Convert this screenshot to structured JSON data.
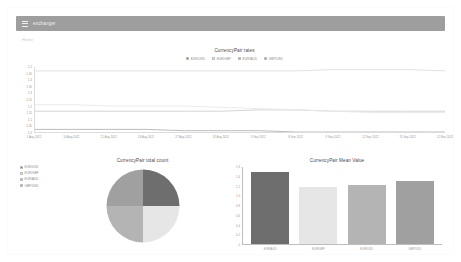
{
  "header": {
    "menu_icon": "hamburger-menu-icon",
    "title": "exchanger"
  },
  "breadcrumb": "Home",
  "colors": {
    "appbar": "#9e9e9e",
    "series1": "#6e6e6e",
    "series2": "#e6e6e6",
    "series3": "#b4b4b4",
    "series4": "#a0a0a0"
  },
  "line_chart": {
    "title": "CurrencyPair rates",
    "legend": [
      {
        "label": "EUR/USD",
        "color": "#6e6e6e"
      },
      {
        "label": "EUR/GBP",
        "color": "#e6e6e6"
      },
      {
        "label": "EUR/AUD",
        "color": "#b4b4b4"
      },
      {
        "label": "GBP/USD",
        "color": "#a0a0a0"
      }
    ]
  },
  "side_legend": [
    {
      "label": "EUR/USD",
      "color": "#6e6e6e"
    },
    {
      "label": "EUR/GBP",
      "color": "#e6e6e6"
    },
    {
      "label": "EUR/AUD",
      "color": "#b4b4b4"
    },
    {
      "label": "GBP/USD",
      "color": "#a0a0a0"
    }
  ],
  "pie_chart": {
    "title": "CurrencyPair total count"
  },
  "bar_chart": {
    "title": "CurrencyPair Mean Value"
  },
  "chart_data": [
    {
      "type": "line",
      "title": "CurrencyPair rates",
      "xlabel": "",
      "ylabel": "",
      "ylim": [
        1.0,
        1.5
      ],
      "yticks": [
        1.5,
        1.45,
        1.4,
        1.35,
        1.3,
        1.25,
        1.2,
        1.15,
        1.1,
        1.05,
        1.0
      ],
      "grid": false,
      "legend_position": "top",
      "x": [
        "1 Aug 2022",
        "14 Aug 2022",
        "21 Aug 2022",
        "24 Aug 2022",
        "27 Aug 2022",
        "31 Aug 2022",
        "3 Sep 2022",
        "6 Sep 2022",
        "9 Sep 2022",
        "12 Sep 2022",
        "15 Sep 2022",
        "12 Nov 2022"
      ],
      "series": [
        {
          "name": "EUR/USD",
          "color": "#b4b4b4",
          "values": [
            1.02,
            1.02,
            1.02,
            1.02,
            1.01,
            1.01,
            1.01,
            1.0,
            1.0,
            1.0,
            1.0,
            1.0
          ]
        },
        {
          "name": "EUR/GBP",
          "color": "#cfcfcf",
          "values": [
            1.16,
            1.16,
            1.16,
            1.16,
            1.16,
            1.16,
            1.17,
            1.17,
            1.16,
            1.16,
            1.16,
            1.16
          ]
        },
        {
          "name": "EUR/AUD",
          "color": "#dedede",
          "values": [
            1.47,
            1.47,
            1.47,
            1.47,
            1.47,
            1.47,
            1.47,
            1.47,
            1.48,
            1.48,
            1.48,
            1.47
          ]
        },
        {
          "name": "GBP/USD",
          "color": "#e8e8e8",
          "values": [
            1.21,
            1.21,
            1.2,
            1.2,
            1.2,
            1.19,
            1.18,
            1.17,
            1.16,
            1.15,
            1.15,
            1.15
          ]
        }
      ]
    },
    {
      "type": "pie",
      "title": "CurrencyPair total count",
      "labels": [
        "EUR/USD",
        "EUR/GBP",
        "EUR/AUD",
        "GBP/USD"
      ],
      "values": [
        25,
        25,
        25,
        25
      ],
      "colors": [
        "#6e6e6e",
        "#e6e6e6",
        "#b4b4b4",
        "#a0a0a0"
      ],
      "legend_position": "left"
    },
    {
      "type": "bar",
      "title": "CurrencyPair Mean Value",
      "categories": [
        "EUR/AUD",
        "EUR/GBP",
        "EUR/USD",
        "GBP/USD"
      ],
      "values": [
        1.47,
        1.16,
        1.21,
        1.3
      ],
      "colors": [
        "#6e6e6e",
        "#e6e6e6",
        "#b4b4b4",
        "#a0a0a0"
      ],
      "xlabel": "",
      "ylabel": "",
      "ylim": [
        0,
        1.6
      ],
      "yticks": [
        1.6,
        1.4,
        1.2,
        1.0,
        0.8,
        0.6,
        0.4,
        0.2,
        0
      ],
      "grid": false
    }
  ]
}
